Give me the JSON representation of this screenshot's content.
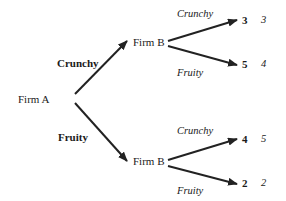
{
  "tree": {
    "root": {
      "player": "Firm A"
    },
    "branches": [
      {
        "move": "Crunchy",
        "node": {
          "player": "Firm B"
        },
        "outcomes": [
          {
            "move": "Crunchy",
            "payoff_a": "3",
            "payoff_b": "3"
          },
          {
            "move": "Fruity",
            "payoff_a": "5",
            "payoff_b": "4"
          }
        ]
      },
      {
        "move": "Fruity",
        "node": {
          "player": "Firm B"
        },
        "outcomes": [
          {
            "move": "Crunchy",
            "payoff_a": "4",
            "payoff_b": "5"
          },
          {
            "move": "Fruity",
            "payoff_a": "2",
            "payoff_b": "2"
          }
        ]
      }
    ]
  },
  "colors": {
    "arrow": "#222222",
    "text": "#1a1a1a",
    "background": "#ffffff"
  }
}
